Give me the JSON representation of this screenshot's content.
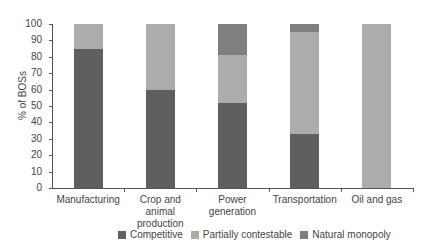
{
  "title_fragment": "",
  "chart_data": {
    "type": "bar",
    "stacked": true,
    "title": "",
    "xlabel": "",
    "ylabel": "% of BOSs",
    "ylim": [
      0,
      100
    ],
    "yticks": [
      0,
      10,
      20,
      30,
      40,
      50,
      60,
      70,
      80,
      90,
      100
    ],
    "categories": [
      "Manufacturing",
      "Crop and animal production",
      "Power generation",
      "Transportation",
      "Oil and gas"
    ],
    "category_lines": [
      [
        "Manufacturing"
      ],
      [
        "Crop and animal",
        "production"
      ],
      [
        "Power",
        "generation"
      ],
      [
        "Transportation"
      ],
      [
        "Oil and gas"
      ]
    ],
    "series": [
      {
        "name": "Competitive",
        "color": "#5f5f5f",
        "values": [
          85,
          60,
          52,
          33,
          0
        ]
      },
      {
        "name": "Partially contestable",
        "color": "#acacac",
        "values": [
          15,
          40,
          29,
          62,
          100
        ]
      },
      {
        "name": "Natural monopoly",
        "color": "#7f7f7f",
        "values": [
          0,
          0,
          19,
          5,
          0
        ]
      }
    ],
    "grid": false,
    "legend_position": "bottom"
  },
  "legend": {
    "items": [
      {
        "label": "Competitive",
        "color": "#5f5f5f"
      },
      {
        "label": "Partially contestable",
        "color": "#acacac"
      },
      {
        "label": "Natural monopoly",
        "color": "#7f7f7f"
      }
    ]
  }
}
